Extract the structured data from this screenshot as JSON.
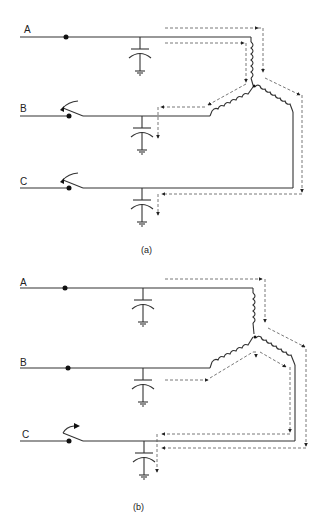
{
  "figure": {
    "panels": [
      {
        "id": "a",
        "caption": "(a)",
        "phases": [
          {
            "label": "A",
            "switch": "closed"
          },
          {
            "label": "B",
            "switch": "open"
          },
          {
            "label": "C",
            "switch": "open"
          }
        ],
        "description": "Phase A energized; B and C switches open; current paths shown via dashed arrows through wye windings and line capacitances to ground"
      },
      {
        "id": "b",
        "caption": "(b)",
        "phases": [
          {
            "label": "A",
            "switch": "closed"
          },
          {
            "label": "B",
            "switch": "closed"
          },
          {
            "label": "C",
            "switch": "open"
          }
        ],
        "description": "Phases A and B energized; C switch open; current paths shown via dashed arrows into phase C capacitance to ground"
      }
    ],
    "colors": {
      "line": "#333333",
      "dashed": "#555555",
      "background": "#ffffff"
    }
  }
}
